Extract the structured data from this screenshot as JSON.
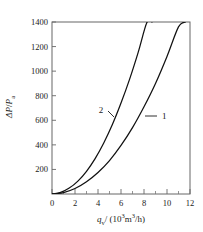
{
  "chart_data": {
    "type": "line",
    "title": "",
    "xlabel": "q_v / ( 10^3 m^3/h )",
    "ylabel": "ΔP/P_a",
    "xlim": [
      0,
      12
    ],
    "ylim": [
      0,
      1400
    ],
    "grid": false,
    "legend_position": "inline-curve-labels",
    "x_ticks": [
      0,
      2,
      4,
      6,
      8,
      10,
      12
    ],
    "x_tick_labels": [
      "0",
      "2",
      "4",
      "6",
      "8",
      "10",
      "12"
    ],
    "x_minor_ticks": [
      1,
      3,
      5,
      7,
      9,
      11
    ],
    "y_ticks": [
      200,
      400,
      600,
      800,
      1000,
      1200,
      1400
    ],
    "y_tick_labels": [
      "200",
      "400",
      "600",
      "800",
      "1000",
      "1200",
      "1400"
    ],
    "series": [
      {
        "name": "1",
        "label": "1",
        "color": "#111111",
        "x": [
          0,
          1,
          2,
          3,
          4,
          5,
          6,
          7,
          8,
          9,
          10,
          11,
          11.6
        ],
        "values": [
          0,
          12,
          45,
          100,
          175,
          272,
          395,
          540,
          710,
          900,
          1120,
          1360,
          1400
        ]
      },
      {
        "name": "2",
        "label": "2",
        "color": "#111111",
        "x": [
          0,
          0.75,
          1.5,
          2.25,
          3,
          3.75,
          4.5,
          5.25,
          6,
          6.75,
          7.5,
          8.25,
          8.7
        ],
        "values": [
          0,
          13,
          48,
          105,
          185,
          288,
          415,
          565,
          740,
          935,
          1155,
          1395,
          1400
        ]
      }
    ],
    "annotations": [
      {
        "text": "2",
        "x_px": 104,
        "y_px": 113,
        "leader": "to-left-curve"
      },
      {
        "text": "1",
        "x_px": 161,
        "y_px": 118,
        "leader": "to-right-curve"
      }
    ]
  },
  "axis_label_parts": {
    "y_delta": "ΔP",
    "y_slash": "/",
    "y_denom": "P",
    "y_denom_sub": "a",
    "x_symbol": "q",
    "x_symbol_sub": "v",
    "x_units_open": "/ (",
    "x_units_base": "10",
    "x_units_exp": "3",
    "x_units_m": "m",
    "x_units_m_exp": "3",
    "x_units_per_h": "/h",
    "x_units_close": ")"
  },
  "style": {
    "axis_color": "#555555",
    "curve_color": "#111111",
    "text_color": "#1a1a1a",
    "background": "#ffffff"
  }
}
